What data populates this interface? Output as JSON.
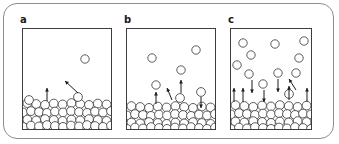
{
  "figure": {
    "width": 339,
    "height": 144,
    "background_color": "#ffffff",
    "frame_color": "#8c8c8c",
    "box_color": "#3d3d3d",
    "particle_stroke_color": "#4a4a4a",
    "arrow_color": "#1a1a1a"
  },
  "chart_data": {
    "type": "diagram",
    "panels": [
      {
        "label": "a",
        "label_x": 20,
        "label_y": 15,
        "box": {
          "x": 22,
          "y": 28,
          "w": 90,
          "h": 102
        },
        "free_particles": [
          {
            "cx": 85,
            "cy": 59,
            "r": 4.2
          }
        ],
        "surface_particles": [
          {
            "cx": 78,
            "cy": 97,
            "r": 4.4
          },
          {
            "cx": 29,
            "cy": 100,
            "r": 4.4
          }
        ],
        "arrows": [
          {
            "x1": 47,
            "y1": 101,
            "x2": 47,
            "y2": 88,
            "dir": "up"
          },
          {
            "x1": 78,
            "y1": 93,
            "x2": 65,
            "y2": 81,
            "dir": "up-left"
          }
        ],
        "bed_rows": [
          {
            "y": 104,
            "count": 10,
            "offset": 0
          },
          {
            "y": 112,
            "count": 11,
            "offset": -4
          },
          {
            "y": 120,
            "count": 10,
            "offset": 0
          },
          {
            "y": 126,
            "count": 11,
            "offset": -4
          }
        ],
        "bed_top_line_y": 100
      },
      {
        "label": "b",
        "label_x": 124,
        "label_y": 15,
        "box": {
          "x": 126,
          "y": 28,
          "w": 90,
          "h": 102
        },
        "free_particles": [
          {
            "cx": 152,
            "cy": 58,
            "r": 4.2
          },
          {
            "cx": 196,
            "cy": 50,
            "r": 4.2
          },
          {
            "cx": 181,
            "cy": 70,
            "r": 4.2
          },
          {
            "cx": 156,
            "cy": 85,
            "r": 4.2
          }
        ],
        "surface_particles": [
          {
            "cx": 180,
            "cy": 98,
            "r": 4.4
          },
          {
            "cx": 201,
            "cy": 92,
            "r": 4.4
          }
        ],
        "arrows": [
          {
            "x1": 156,
            "y1": 104,
            "x2": 156,
            "y2": 92,
            "dir": "up"
          },
          {
            "x1": 172,
            "y1": 100,
            "x2": 167,
            "y2": 88,
            "dir": "up-left"
          },
          {
            "x1": 181,
            "y1": 93,
            "x2": 181,
            "y2": 80,
            "dir": "up"
          },
          {
            "x1": 201,
            "y1": 97,
            "x2": 201,
            "y2": 108,
            "dir": "down"
          }
        ],
        "bed_rows": [
          {
            "y": 107,
            "count": 10,
            "offset": 0
          },
          {
            "y": 115,
            "count": 11,
            "offset": -4
          },
          {
            "y": 123,
            "count": 10,
            "offset": 0
          },
          {
            "y": 128,
            "count": 11,
            "offset": -4
          }
        ],
        "bed_top_line_y": 104
      },
      {
        "label": "c",
        "label_x": 228,
        "label_y": 15,
        "box": {
          "x": 230,
          "y": 28,
          "w": 82,
          "h": 102
        },
        "free_particles": [
          {
            "cx": 243,
            "cy": 43,
            "r": 4.2
          },
          {
            "cx": 275,
            "cy": 44,
            "r": 4.2
          },
          {
            "cx": 304,
            "cy": 41,
            "r": 4.2
          },
          {
            "cx": 251,
            "cy": 55,
            "r": 4.2
          },
          {
            "cx": 299,
            "cy": 58,
            "r": 4.2
          },
          {
            "cx": 237,
            "cy": 65,
            "r": 4.2
          },
          {
            "cx": 249,
            "cy": 74,
            "r": 4.2
          },
          {
            "cx": 278,
            "cy": 73,
            "r": 4.2
          },
          {
            "cx": 296,
            "cy": 73,
            "r": 4.2
          },
          {
            "cx": 263,
            "cy": 84,
            "r": 4.2
          }
        ],
        "surface_particles": [
          {
            "cx": 289,
            "cy": 94,
            "r": 4.4
          }
        ],
        "arrows": [
          {
            "x1": 234,
            "y1": 102,
            "x2": 234,
            "y2": 88,
            "dir": "up"
          },
          {
            "x1": 243,
            "y1": 102,
            "x2": 243,
            "y2": 88,
            "dir": "up"
          },
          {
            "x1": 252,
            "y1": 80,
            "x2": 252,
            "y2": 93,
            "dir": "down"
          },
          {
            "x1": 264,
            "y1": 90,
            "x2": 264,
            "y2": 102,
            "dir": "down"
          },
          {
            "x1": 278,
            "y1": 79,
            "x2": 278,
            "y2": 92,
            "dir": "down"
          },
          {
            "x1": 289,
            "y1": 100,
            "x2": 289,
            "y2": 86,
            "dir": "up"
          },
          {
            "x1": 296,
            "y1": 90,
            "x2": 289,
            "y2": 79,
            "dir": "up-left"
          },
          {
            "x1": 307,
            "y1": 102,
            "x2": 307,
            "y2": 88,
            "dir": "up"
          }
        ],
        "bed_rows": [
          {
            "y": 106,
            "count": 9,
            "offset": 0
          },
          {
            "y": 114,
            "count": 10,
            "offset": -4
          },
          {
            "y": 122,
            "count": 9,
            "offset": 0
          },
          {
            "y": 128,
            "count": 10,
            "offset": -4
          }
        ],
        "bed_top_line_y": 102
      }
    ]
  }
}
